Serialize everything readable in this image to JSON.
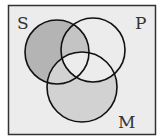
{
  "diagram": {
    "type": "venn",
    "sets": [
      {
        "label": "S",
        "shading": "S-only region shaded"
      },
      {
        "label": "P",
        "shading": "P∩S (outside M) shaded"
      },
      {
        "label": "M",
        "shading": "M outside P shaded"
      }
    ],
    "labels": {
      "s": "S",
      "p": "P",
      "m": "M"
    },
    "colors": {
      "frame_fill": "#ececec",
      "frame_stroke": "#333333",
      "circle_stroke": "#111111",
      "shade_dark": "#b4b4b4",
      "shade_light": "#cfcfcf",
      "label": "#333333"
    }
  }
}
